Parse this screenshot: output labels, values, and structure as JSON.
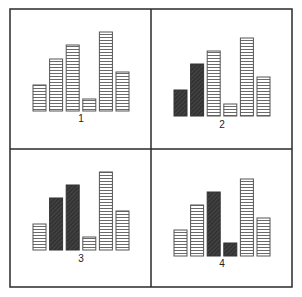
{
  "figure": {
    "layout": "2x2 grid of bar-chart panels",
    "frame": {
      "x": 10,
      "y": 9,
      "width": 282,
      "height": 278,
      "divider_x": 151,
      "divider_y": 149
    },
    "colors": {
      "frame": "#2a2a2a",
      "striped_outline": "#555555",
      "striped_fill": "#ffffff",
      "stripe_line": "#6a6a6a",
      "dark_fill": "#333333",
      "dark_hatch": "#5a5a5a",
      "label": "#222222"
    }
  },
  "chart_data": [
    {
      "type": "bar",
      "title": "1",
      "categories": [
        "1",
        "2",
        "3",
        "4",
        "5",
        "6"
      ],
      "values": [
        26,
        52,
        66,
        12,
        79,
        39
      ],
      "highlighted": [
        false,
        false,
        false,
        false,
        false,
        false
      ],
      "xlabel": "",
      "ylabel": "",
      "grid": false
    },
    {
      "type": "bar",
      "title": "2",
      "categories": [
        "1",
        "2",
        "3",
        "4",
        "5",
        "6"
      ],
      "values": [
        26,
        52,
        65,
        12,
        78,
        39
      ],
      "highlighted": [
        true,
        true,
        false,
        false,
        false,
        false
      ],
      "xlabel": "",
      "ylabel": "",
      "grid": false
    },
    {
      "type": "bar",
      "title": "3",
      "categories": [
        "1",
        "2",
        "3",
        "4",
        "5",
        "6"
      ],
      "values": [
        26,
        52,
        65,
        13,
        78,
        39
      ],
      "highlighted": [
        false,
        true,
        true,
        false,
        false,
        false
      ],
      "xlabel": "",
      "ylabel": "",
      "grid": false
    },
    {
      "type": "bar",
      "title": "4",
      "categories": [
        "1",
        "2",
        "3",
        "4",
        "5",
        "6"
      ],
      "values": [
        26,
        51,
        64,
        13,
        77,
        38
      ],
      "highlighted": [
        false,
        false,
        true,
        true,
        false,
        false
      ],
      "xlabel": "",
      "ylabel": "",
      "grid": false
    }
  ],
  "panels": [
    {
      "label": "1",
      "origin_x": 33,
      "baseline_y": 111,
      "label_y": 122
    },
    {
      "label": "2",
      "origin_x": 174,
      "baseline_y": 116,
      "label_y": 128
    },
    {
      "label": "3",
      "origin_x": 33,
      "baseline_y": 250,
      "label_y": 262
    },
    {
      "label": "4",
      "origin_x": 174,
      "baseline_y": 256,
      "label_y": 267
    }
  ]
}
